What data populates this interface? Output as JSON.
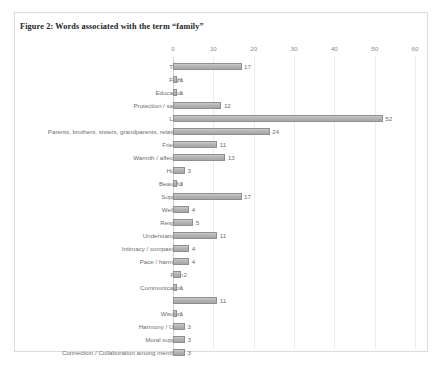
{
  "figure": {
    "title": "Figure 2: Words associated with the term “family”"
  },
  "chart_data": {
    "type": "bar",
    "orientation": "horizontal",
    "title": "Figure 2: Words associated with the term “family”",
    "xlabel": "",
    "ylabel": "",
    "xlim": [
      0,
      60
    ],
    "xticks": [
      0,
      10,
      20,
      30,
      40,
      50,
      60
    ],
    "xtick_labels": [
      "0",
      "10",
      "20",
      "30",
      "40",
      "50",
      "60"
    ],
    "grid": true,
    "legend": false,
    "data_labels": true,
    "bar_color": "#b4b4b4",
    "bar_edge_color": "#8f8f8f",
    "categories": [
      "Trust",
      "Fight",
      "Education",
      "Protection / safety",
      "Love",
      "Parents, brothers, sisters, grandparents, relatives",
      "Friends",
      "Warmth / affection",
      "Home",
      "Beautiful",
      "Support",
      "Welfare",
      "Respect",
      "Understanding",
      "Intimacy / compassion",
      "Pace / harmony",
      "Pain",
      "Communication",
      "Joy",
      "Wisdom",
      "Harmony / Unity",
      "Moral support",
      "Connection / Collaboration among members"
    ],
    "values": [
      17,
      1,
      1,
      12,
      52,
      24,
      11,
      13,
      3,
      1,
      17,
      4,
      5,
      11,
      4,
      4,
      2,
      1,
      11,
      1,
      3,
      3,
      3
    ]
  }
}
